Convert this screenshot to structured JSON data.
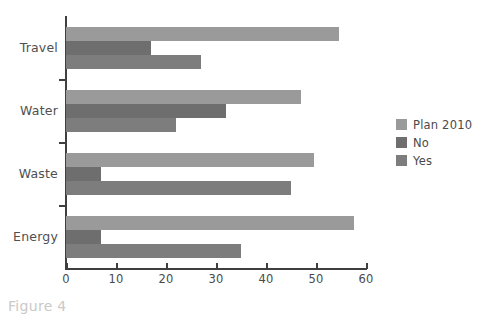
{
  "caption": "Figure 4",
  "chart_data": {
    "type": "bar",
    "orientation": "horizontal",
    "title": "",
    "xlabel": "",
    "ylabel": "",
    "categories": [
      "Travel",
      "Water",
      "Waste",
      "Energy"
    ],
    "series": [
      {
        "name": "Plan 2010",
        "color": "#9a9a9a",
        "values": [
          54.5,
          47,
          49.5,
          57.5
        ]
      },
      {
        "name": "No",
        "color": "#6e6e6e",
        "values": [
          17,
          32,
          7,
          7
        ]
      },
      {
        "name": "Yes",
        "color": "#7d7d7d",
        "values": [
          27,
          22,
          45,
          35
        ]
      }
    ],
    "xlim": [
      0,
      60
    ],
    "xticks": [
      0,
      10,
      20,
      30,
      40,
      50,
      60
    ],
    "xtick_labels": [
      "0",
      "10",
      "20",
      "30",
      "40",
      "50",
      "60"
    ],
    "grid": false,
    "legend_position": "right",
    "axis_color": "#3f3f3f",
    "background": "#ffffff"
  }
}
